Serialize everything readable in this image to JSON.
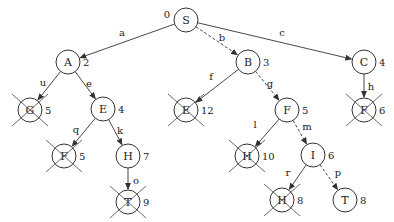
{
  "diagram": {
    "type": "search-tree",
    "nodes": [
      {
        "id": "n0",
        "label": "S",
        "cost": "0",
        "x": 186,
        "y": 20,
        "crossed": false,
        "cost_side": "left"
      },
      {
        "id": "n1",
        "label": "A",
        "cost": "2",
        "x": 68,
        "y": 62,
        "crossed": false
      },
      {
        "id": "n2",
        "label": "B",
        "cost": "3",
        "x": 248,
        "y": 62,
        "crossed": false
      },
      {
        "id": "n3",
        "label": "C",
        "cost": "4",
        "x": 364,
        "y": 62,
        "crossed": false
      },
      {
        "id": "n4",
        "label": "G",
        "cost": "5",
        "x": 30,
        "y": 110,
        "crossed": true
      },
      {
        "id": "n5",
        "label": "E",
        "cost": "4",
        "x": 103,
        "y": 109,
        "crossed": false
      },
      {
        "id": "n6",
        "label": "E",
        "cost": "12",
        "x": 186,
        "y": 110,
        "crossed": true
      },
      {
        "id": "n7",
        "label": "F",
        "cost": "5",
        "x": 287,
        "y": 110,
        "crossed": false
      },
      {
        "id": "n8",
        "label": "F",
        "cost": "6",
        "x": 364,
        "y": 110,
        "crossed": true
      },
      {
        "id": "n9",
        "label": "F",
        "cost": "5",
        "x": 64,
        "y": 156,
        "crossed": true
      },
      {
        "id": "n10",
        "label": "H",
        "cost": "7",
        "x": 128,
        "y": 156,
        "crossed": false
      },
      {
        "id": "n11",
        "label": "H",
        "cost": "10",
        "x": 247,
        "y": 156,
        "crossed": true
      },
      {
        "id": "n12",
        "label": "I",
        "cost": "6",
        "x": 313,
        "y": 155,
        "crossed": false
      },
      {
        "id": "n13",
        "label": "T",
        "cost": "9",
        "x": 128,
        "y": 202,
        "crossed": true
      },
      {
        "id": "n14",
        "label": "H",
        "cost": "8",
        "x": 282,
        "y": 200,
        "crossed": true
      },
      {
        "id": "n15",
        "label": "T",
        "cost": "8",
        "x": 345,
        "y": 200,
        "crossed": false
      }
    ],
    "edges": [
      {
        "from": "n0",
        "to": "n1",
        "label": "a",
        "dashed": false,
        "lx": 122,
        "ly": 32
      },
      {
        "from": "n0",
        "to": "n2",
        "label": "b",
        "dashed": true,
        "lx": 222,
        "ly": 37
      },
      {
        "from": "n0",
        "to": "n3",
        "label": "c",
        "dashed": false,
        "lx": 282,
        "ly": 32
      },
      {
        "from": "n1",
        "to": "n4",
        "label": "u",
        "dashed": false,
        "lx": 43,
        "ly": 82
      },
      {
        "from": "n1",
        "to": "n5",
        "label": "e",
        "dashed": false,
        "lx": 89,
        "ly": 83
      },
      {
        "from": "n5",
        "to": "n9",
        "label": "q",
        "dashed": false,
        "lx": 76,
        "ly": 129
      },
      {
        "from": "n5",
        "to": "n10",
        "label": "k",
        "dashed": false,
        "lx": 120,
        "ly": 130
      },
      {
        "from": "n10",
        "to": "n13",
        "label": "o",
        "dashed": false,
        "lx": 136,
        "ly": 180
      },
      {
        "from": "n2",
        "to": "n6",
        "label": "f",
        "dashed": false,
        "lx": 211,
        "ly": 76
      },
      {
        "from": "n2",
        "to": "n7",
        "label": "g",
        "dashed": true,
        "lx": 270,
        "ly": 83
      },
      {
        "from": "n7",
        "to": "n11",
        "label": "l",
        "dashed": false,
        "lx": 255,
        "ly": 124
      },
      {
        "from": "n7",
        "to": "n12",
        "label": "m",
        "dashed": true,
        "lx": 307,
        "ly": 126
      },
      {
        "from": "n12",
        "to": "n14",
        "label": "r",
        "dashed": false,
        "lx": 288,
        "ly": 172
      },
      {
        "from": "n12",
        "to": "n15",
        "label": "p",
        "dashed": true,
        "lx": 338,
        "ly": 172
      },
      {
        "from": "n3",
        "to": "n8",
        "label": "h",
        "dashed": false,
        "lx": 371,
        "ly": 86
      }
    ],
    "colors": {
      "stroke": "#333333",
      "background": "#ffffff",
      "text": "#222222"
    }
  }
}
